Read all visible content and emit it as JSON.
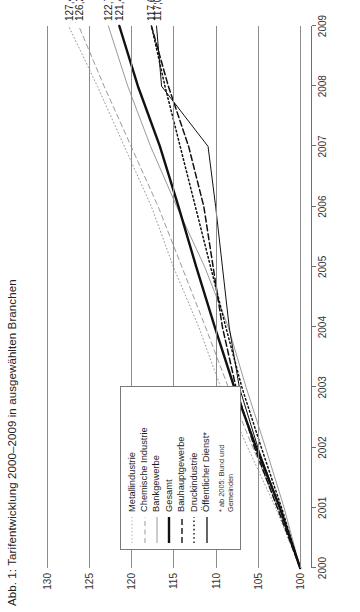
{
  "title": "Abb. 1: Tarifentwicklung 2000–2009 in ausgewählten Branchen",
  "legend": {
    "note": "* ab 2005: Bund und Gemeinden",
    "items": [
      {
        "label": "Metallindustrie",
        "style": "dotted-fine",
        "color": "#9a9a9a",
        "width": 1.0
      },
      {
        "label": "Chemische Industrie",
        "style": "dashed",
        "color": "#9a9a9a",
        "width": 1.0
      },
      {
        "label": "Bankgewerbe",
        "style": "solid",
        "color": "#9a9a9a",
        "width": 1.0
      },
      {
        "label": "Gesamt",
        "style": "solid",
        "color": "#111111",
        "width": 2.4
      },
      {
        "label": "Bauhauptgewerbe",
        "style": "dashed-heavy",
        "color": "#111111",
        "width": 1.4
      },
      {
        "label": "Druckindustrie",
        "style": "dotted",
        "color": "#111111",
        "width": 1.4
      },
      {
        "label": "Öffentlicher Dienst*",
        "style": "solid",
        "color": "#111111",
        "width": 1.3
      }
    ]
  },
  "end_labels": [
    "127,4",
    "126,2",
    "122,7",
    "121,4",
    "117,6",
    "117,0"
  ],
  "chart_data": {
    "type": "line",
    "title": "Abb. 1: Tarifentwicklung 2000–2009 in ausgewählten Branchen",
    "xlabel": "",
    "ylabel": "",
    "x": [
      2000,
      2001,
      2002,
      2003,
      2004,
      2005,
      2006,
      2007,
      2008,
      2009
    ],
    "xticklabels": [
      "2000",
      "2001",
      "2002",
      "2003",
      "2004",
      "2005",
      "2006",
      "2007",
      "2008",
      "2009"
    ],
    "yticks": [
      100,
      105,
      110,
      115,
      120,
      125,
      130
    ],
    "ylim": [
      98.6,
      131.5
    ],
    "xlim": [
      2000,
      2009
    ],
    "grid": "horizontal",
    "legend_position": "lower-left-inside",
    "series": [
      {
        "name": "Metallindustrie",
        "end_value": 127.4,
        "color": "#9a9a9a",
        "style": "dotted-fine",
        "values": [
          100.0,
          102.9,
          106.2,
          109.4,
          112.0,
          115.0,
          117.6,
          120.8,
          124.0,
          127.4
        ]
      },
      {
        "name": "Chemische Industrie",
        "end_value": 126.2,
        "color": "#9a9a9a",
        "style": "dashed",
        "values": [
          100.0,
          102.6,
          105.6,
          108.5,
          111.2,
          114.0,
          116.8,
          120.0,
          123.2,
          126.2
        ]
      },
      {
        "name": "Bankgewerbe",
        "end_value": 122.7,
        "color": "#9a9a9a",
        "style": "solid",
        "values": [
          100.0,
          101.9,
          104.1,
          106.4,
          108.5,
          111.3,
          114.6,
          117.7,
          120.4,
          122.7
        ]
      },
      {
        "name": "Gesamt",
        "end_value": 121.4,
        "color": "#111111",
        "style": "solid-thick",
        "values": [
          100.0,
          102.4,
          105.2,
          107.8,
          110.1,
          112.3,
          114.4,
          116.6,
          119.2,
          121.4
        ]
      },
      {
        "name": "Bauhauptgewerbe",
        "end_value": 117.6,
        "color": "#111111",
        "style": "dashed-heavy",
        "values": [
          100.0,
          102.7,
          105.4,
          107.6,
          109.2,
          110.3,
          111.4,
          113.2,
          115.6,
          117.6
        ]
      },
      {
        "name": "Druckindustrie",
        "end_value": 117.6,
        "color": "#111111",
        "style": "dotted",
        "values": [
          100.0,
          102.2,
          104.6,
          106.9,
          108.8,
          110.6,
          112.4,
          114.2,
          116.0,
          117.6
        ]
      },
      {
        "name": "Öffentlicher Dienst*",
        "end_value": 117.0,
        "color": "#111111",
        "style": "solid",
        "values": [
          100.0,
          102.4,
          105.0,
          107.2,
          108.4,
          109.2,
          110.0,
          110.9,
          116.4,
          117.0
        ]
      }
    ]
  }
}
